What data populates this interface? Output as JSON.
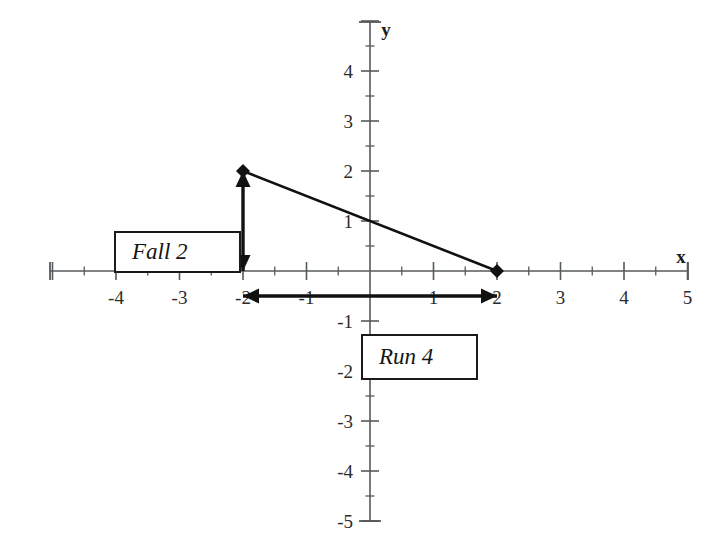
{
  "chart_data": {
    "type": "line",
    "title": "",
    "xlabel": "x",
    "ylabel": "y",
    "xlim": [
      -5,
      5
    ],
    "ylim": [
      -5,
      5
    ],
    "grid": false,
    "legend": "none",
    "x_tick_labels": [
      "-4",
      "-3",
      "-2",
      "-1",
      "1",
      "2",
      "3",
      "4",
      "5"
    ],
    "x_tick_values": [
      -4,
      -3,
      -2,
      -1,
      1,
      2,
      3,
      4,
      5
    ],
    "y_tick_labels": [
      "4",
      "3",
      "2",
      "1",
      "-1",
      "-2",
      "-3",
      "-4",
      "-5"
    ],
    "y_tick_values": [
      4,
      3,
      2,
      1,
      -1,
      -2,
      -3,
      -4,
      -5
    ],
    "minor_tick_step": 0.5,
    "series": [
      {
        "name": "segment",
        "points": [
          {
            "x": -2,
            "y": 2
          },
          {
            "x": 2,
            "y": 0
          }
        ],
        "marker": "diamond",
        "color": "#111111"
      }
    ],
    "annotations": [
      {
        "name": "fall",
        "label": "Fall 2",
        "value": 2,
        "from": {
          "x": -2,
          "y": 2
        },
        "to": {
          "x": -2,
          "y": 0
        },
        "arrow": "double",
        "orientation": "vertical"
      },
      {
        "name": "run",
        "label": "Run 4",
        "value": 4,
        "from": {
          "x": -2,
          "y": -0.5
        },
        "to": {
          "x": 2,
          "y": -0.5
        },
        "arrow": "double",
        "orientation": "horizontal"
      }
    ]
  },
  "axes": {
    "x_axis_label": "x",
    "y_axis_label": "y"
  },
  "callouts": {
    "fall": {
      "label": "Fall 2"
    },
    "run": {
      "label": "Run 4"
    }
  },
  "colors": {
    "axis": "#555a5c",
    "line": "#111111",
    "text": "#1a1a1a",
    "box_border": "#1a1a1a",
    "box_fill": "#ffffff",
    "background": "#ffffff"
  }
}
